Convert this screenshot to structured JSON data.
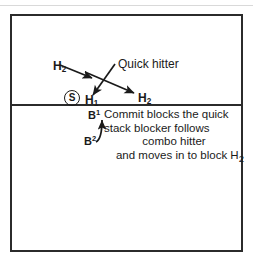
{
  "diagram": {
    "court": {
      "net_label": "net-line",
      "border_color": "#2b2b2b",
      "background_color": "#ffffff"
    },
    "players": {
      "setter": {
        "label": "S",
        "name": "setter-marker"
      },
      "h2_left": {
        "label_text": "H",
        "subscript": "2"
      },
      "h1": {
        "label_text": "H",
        "subscript": "1"
      },
      "h2_right": {
        "label_text": "H",
        "subscript": "2"
      },
      "b1": {
        "label_text": "B",
        "superscript": "1"
      },
      "b2": {
        "label_text": "B",
        "superscript": "2"
      }
    },
    "annotations": {
      "quick_hitter": "Quick hitter"
    },
    "note": {
      "lines": [
        "Commit blocks the quick",
        "stack blocker follows",
        "combo hitter",
        "and moves in to block H"
      ],
      "last_line_subscript": "2"
    }
  }
}
